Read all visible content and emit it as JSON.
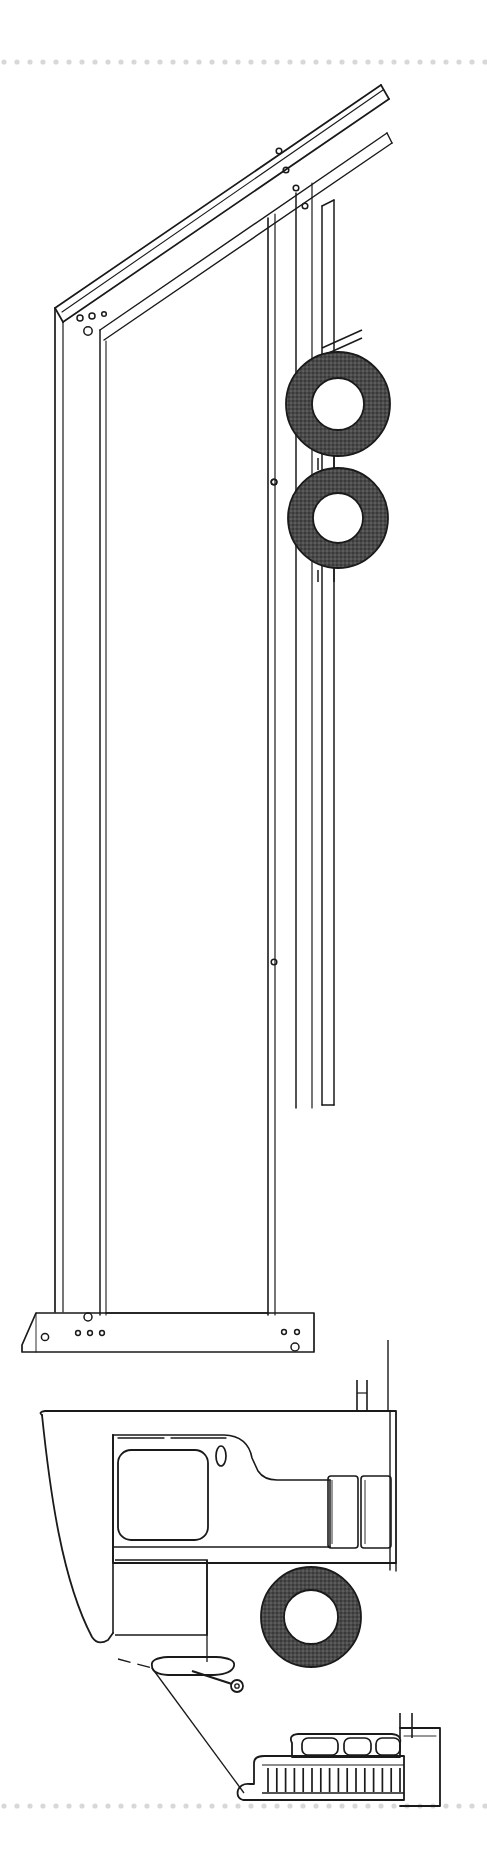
{
  "document": {
    "kind": "technical-line-drawing",
    "subject": "dump-truck-side-elevation",
    "orientation": "portrait",
    "width_px": 487,
    "height_px": 1866,
    "background_color": "#ffffff",
    "ink_color": "#1a1a1a",
    "tire_fill_color": "#4a4a4a",
    "hub_fill_color": "#ffffff",
    "scan_edge_color": "#dcdcdc"
  },
  "scan_artifacts": {
    "top_dotted_rule": {
      "name": "scanner-edge-dotted-line-top",
      "y": 62,
      "dot_color": "#d8d8d8",
      "dot_spacing": 13,
      "dot_radius": 2.6
    },
    "bottom_dotted_rule": {
      "name": "scanner-edge-dotted-line-bottom",
      "y": 1806,
      "dot_color": "#d8d8d8",
      "dot_spacing": 13,
      "dot_radius": 2.6
    }
  },
  "assembly": {
    "title": "Dump Truck — Side Elevation, Body Raised",
    "parts": [
      {
        "id": "dump-body",
        "label": "Dump Body / Tipper Bed",
        "description": "Long rectangular body tilted nose-up with top rail, side panel and floor rail",
        "tilt_angle_deg": 18
      },
      {
        "id": "top-rail",
        "label": "Upper Side Rail",
        "description": "Narrow double-line rail running the full length of the raised body"
      },
      {
        "id": "rear-post",
        "label": "Rear Corner Post",
        "description": "Vertical post at the rear (left) end of the body carrying four bolt holes"
      },
      {
        "id": "front-post",
        "label": "Front Bulkhead Post",
        "description": "Vertical post at the forward (right) end of the body"
      },
      {
        "id": "floor-rail",
        "label": "Lower Floor Rail / Long Sill",
        "description": "Horizontal sill at the bottom of the body with mounting bolt holes at both ends"
      },
      {
        "id": "hoist-cylinder",
        "label": "Hoist Cylinder Shroud",
        "description": "Narrow vertical column behind the cab that supports the raised body"
      },
      {
        "id": "rear-tandem-wheels",
        "label": "Rear Tandem Wheels",
        "description": "Two dark tires with white hubs mounted on the tandem rear axles"
      },
      {
        "id": "front-wheel",
        "label": "Front Steer Wheel",
        "description": "Single dark tire with white hub at the front axle"
      },
      {
        "id": "cab",
        "label": "Cab / Operator Station",
        "description": "Forward cab with sloped nose, side window, lower access door panel and grab handle"
      },
      {
        "id": "cab-window",
        "label": "Cab Side Window",
        "description": "Large rounded-rectangle window opening in the cab side"
      },
      {
        "id": "door-handle",
        "label": "Door Handle",
        "description": "Small vertical oval handle on the cab side"
      },
      {
        "id": "lower-door-panel",
        "label": "Lower Access Panel",
        "description": "Rectangular panel beneath the cab window"
      },
      {
        "id": "step",
        "label": "Access Step",
        "description": "Flattened oval step below the cab door with a pivot pin"
      },
      {
        "id": "fender-stack",
        "label": "Fender / Deck Plates",
        "description": "Two tall narrow rectangles behind the cab forming the deck plates"
      },
      {
        "id": "front-bumper",
        "label": "Front Bumper and Grille",
        "description": "Stepped bumper with three rounded lamp bezels above a row of vertical grille slats"
      },
      {
        "id": "grille-slats",
        "label": "Radiator Grille Slats",
        "description": "Row of short vertical bars across the lower bumper face",
        "count": 16
      },
      {
        "id": "lamp-bezels",
        "label": "Lamp Bezels",
        "description": "Three rounded rectangular lamp housings on the bumper top face",
        "count": 3
      },
      {
        "id": "leader-line",
        "label": "Leader Line",
        "description": "Thin callout line running from the cab step down to the front bumper"
      }
    ],
    "fasteners": [
      {
        "name": "rear-post-bolt-hole",
        "x": 80,
        "y": 318,
        "r": 3.0
      },
      {
        "name": "rear-post-bolt-hole",
        "x": 92,
        "y": 316,
        "r": 3.0
      },
      {
        "name": "rear-post-bolt-hole",
        "x": 104,
        "y": 314,
        "r": 2.4
      },
      {
        "name": "rear-post-bolt-hole-large",
        "x": 88,
        "y": 330,
        "r": 4.2
      },
      {
        "name": "top-rail-bolt-hole",
        "x": 278,
        "y": 152,
        "r": 3.0
      },
      {
        "name": "top-rail-bolt-hole",
        "x": 285,
        "y": 170,
        "r": 3.0
      },
      {
        "name": "top-rail-bolt-hole",
        "x": 296,
        "y": 188,
        "r": 3.0
      },
      {
        "name": "mid-rail-bolt-hole",
        "x": 305,
        "y": 206,
        "r": 3.0
      },
      {
        "name": "mid-stile-bolt-hole",
        "x": 273,
        "y": 482,
        "r": 3.0
      },
      {
        "name": "mid-stile-bolt-hole",
        "x": 273,
        "y": 962,
        "r": 3.0
      },
      {
        "name": "floor-rail-bolt-hole",
        "x": 45,
        "y": 1337,
        "r": 3.8
      },
      {
        "name": "floor-rail-bolt-hole",
        "x": 78,
        "y": 1333,
        "r": 2.6
      },
      {
        "name": "floor-rail-bolt-hole",
        "x": 90,
        "y": 1333,
        "r": 2.6
      },
      {
        "name": "floor-rail-bolt-hole",
        "x": 102,
        "y": 1333,
        "r": 2.6
      },
      {
        "name": "floor-rail-bolt-hole-large",
        "x": 88,
        "y": 1318,
        "r": 4.0
      },
      {
        "name": "floor-rail-bolt-hole",
        "x": 282,
        "y": 1333,
        "r": 2.6
      },
      {
        "name": "floor-rail-bolt-hole",
        "x": 295,
        "y": 1333,
        "r": 2.6
      },
      {
        "name": "floor-rail-bolt-hole-large",
        "x": 294,
        "y": 1347,
        "r": 4.0
      }
    ]
  },
  "chart_data": {
    "type": "table",
    "columns": [
      "part",
      "center_x",
      "center_y",
      "outer_radius",
      "hub_radius"
    ],
    "rows": [
      [
        "rear-upper-tire",
        338,
        404,
        52,
        26
      ],
      [
        "rear-lower-tire",
        338,
        518,
        50,
        25
      ],
      [
        "front-tire",
        311,
        1617,
        50,
        27
      ]
    ]
  }
}
